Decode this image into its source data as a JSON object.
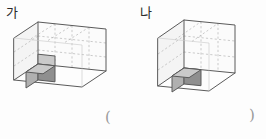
{
  "page": {
    "background_color": "#fdfdfd",
    "width": 266,
    "height": 139
  },
  "figures": [
    {
      "id": "ga",
      "label": "가",
      "shape": "rectangular-cuboid-isometric",
      "units": {
        "width": 4,
        "depth": 1,
        "height": 3
      },
      "total_unit_cubes": 12,
      "highlighted_cube": {
        "count": 1,
        "position": "front-bottom-left",
        "color_top": "#c9c9c9",
        "color_left": "#b0b0b0",
        "color_right": "#8f8f8f"
      },
      "edge_color": "#5a5a5a",
      "grid_line_color": "#b5b5b5",
      "grid_line_style": "dashed"
    },
    {
      "id": "na",
      "label": "나",
      "shape": "rectangular-cuboid-isometric",
      "units": {
        "width": 3,
        "depth": 1,
        "height": 3
      },
      "total_unit_cubes": 9,
      "highlighted_cube": {
        "count": 1,
        "position": "front-bottom-center",
        "color_top": "#c9c9c9",
        "color_left": "#b0b0b0",
        "color_right": "#8f8f8f"
      },
      "edge_color": "#5a5a5a",
      "grid_line_color": "#b5b5b5",
      "grid_line_style": "dashed"
    }
  ],
  "answer_field": {
    "open_paren": "(",
    "close_paren": ")",
    "value": ""
  }
}
